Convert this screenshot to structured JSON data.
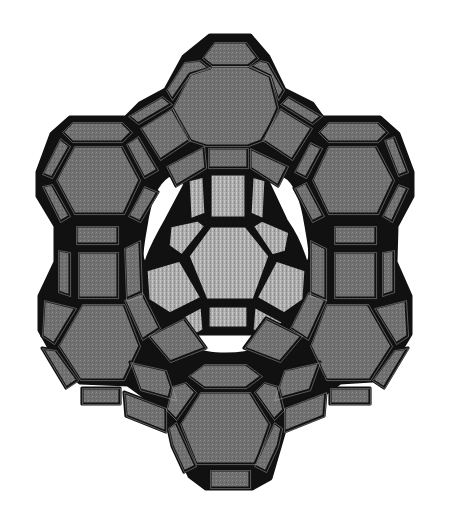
{
  "figure": {
    "width": 451,
    "height": 522,
    "colors": {
      "background": "#ffffff",
      "outer_face": "#6e6e6e",
      "outer_face_light": "#8a8a8a",
      "inner_face": "#a9a9a9",
      "inner_face_light": "#bdbdbd",
      "edge": "#111111",
      "pore": "#ffffff"
    },
    "silhouette": "M210,36 L250,36 L268,57 L284,90 L312,104 L322,118 L380,118 L398,134 L412,172 L412,196 L396,226 L395,262 L410,296 L410,334 L392,364 L372,380 L340,382 L318,398 L300,414 L284,430 L270,478 L252,488 L206,488 L190,476 L170,430 L150,400 L128,384 L80,382 L58,362 L40,330 L40,296 L56,262 L56,226 L38,196 L38,172 L52,134 L70,118 L126,118 L140,104 L166,90 L184,57 Z",
    "outer_faces": [
      {
        "name": "top-cage-top-square",
        "d": "M214,42 L246,42 L258,58 L248,66 L212,66 L202,58 Z"
      },
      {
        "name": "top-cage-hexagon",
        "d": "M190,74 L212,66 L248,66 L270,76 L278,108 L264,140 L248,146 L206,146 L188,140 L172,108 Z"
      },
      {
        "name": "top-cage-left-square",
        "d": "M184,62 L200,60 L210,68 L190,74 L172,100 L166,90 Z"
      },
      {
        "name": "top-cage-right-square",
        "d": "M250,66 L260,60 L268,62 L284,90 L278,100 L270,76 Z"
      },
      {
        "name": "top-left-link",
        "d": "M128,116 L162,96 L172,104 L138,124 Z"
      },
      {
        "name": "top-left-link-2",
        "d": "M140,128 L172,108 L190,140 L160,160 Z"
      },
      {
        "name": "top-right-link",
        "d": "M288,96 L322,116 L312,124 L280,104 Z"
      },
      {
        "name": "top-right-link-2",
        "d": "M280,108 L312,128 L292,160 L262,140 Z"
      },
      {
        "name": "top-bottom-square",
        "d": "M208,148 L248,148 L248,168 L208,168 Z"
      },
      {
        "name": "top-lower-left",
        "d": "M166,166 L204,146 L206,168 L176,186 Z"
      },
      {
        "name": "top-lower-right",
        "d": "M250,148 L288,166 L278,186 L250,168 Z"
      },
      {
        "name": "left-cage-top-square",
        "d": "M72,122 L122,122 L132,132 L122,142 L72,142 L62,132 Z"
      },
      {
        "name": "left-cage-hexagon",
        "d": "M74,146 L122,146 L140,180 L124,214 L74,214 L56,180 Z"
      },
      {
        "name": "left-cage-left-upper",
        "d": "M60,138 L70,146 L52,178 L42,174 Z"
      },
      {
        "name": "left-cage-left-lower",
        "d": "M42,186 L52,184 L70,216 L60,222 Z"
      },
      {
        "name": "left-cage-right-upper",
        "d": "M126,144 L138,136 L158,170 L144,178 Z"
      },
      {
        "name": "left-cage-right-lower",
        "d": "M144,186 L158,192 L140,222 L128,216 Z"
      },
      {
        "name": "left-prism-top",
        "d": "M76,226 L118,226 L118,244 L76,244 Z"
      },
      {
        "name": "left-prism-front",
        "d": "M78,252 L118,252 L118,298 L78,298 Z"
      },
      {
        "name": "left-prism-left",
        "d": "M58,250 L70,252 L70,296 L58,292 Z"
      },
      {
        "name": "left-prism-right",
        "d": "M124,248 L140,240 L142,296 L126,300 Z"
      },
      {
        "name": "right-cage-top-square",
        "d": "M328,122 L378,122 L388,132 L378,142 L328,142 L318,132 Z"
      },
      {
        "name": "right-cage-hexagon",
        "d": "M328,146 L376,146 L394,180 L378,214 L328,214 L312,180 Z"
      },
      {
        "name": "right-cage-left-upper",
        "d": "M310,142 L322,148 L306,178 L294,172 Z"
      },
      {
        "name": "right-cage-left-lower",
        "d": "M294,188 L306,182 L324,216 L312,222 Z"
      },
      {
        "name": "right-cage-right-upper",
        "d": "M384,140 L394,136 L408,172 L398,176 Z"
      },
      {
        "name": "right-cage-right-lower",
        "d": "M398,184 L408,188 L392,222 L382,216 Z"
      },
      {
        "name": "right-prism-top",
        "d": "M334,226 L376,226 L376,244 L334,244 Z"
      },
      {
        "name": "right-prism-front",
        "d": "M334,252 L376,252 L376,298 L334,298 Z"
      },
      {
        "name": "right-prism-left",
        "d": "M310,240 L326,248 L326,300 L310,296 Z"
      },
      {
        "name": "right-prism-right",
        "d": "M382,252 L394,250 L394,292 L382,296 Z"
      },
      {
        "name": "lower-left-cage-hexagon",
        "d": "M82,304 L124,304 L140,346 L124,380 L80,380 L58,346 Z"
      },
      {
        "name": "lower-left-cage-left",
        "d": "M44,300 L76,308 L54,344 L42,336 Z"
      },
      {
        "name": "lower-left-cage-left-lower",
        "d": "M42,348 L56,350 L78,380 L66,388 Z"
      },
      {
        "name": "lower-left-cage-bottom",
        "d": "M82,388 L120,388 L120,404 L82,404 Z"
      },
      {
        "name": "lower-left-cage-right",
        "d": "M124,300 L142,292 L160,328 L142,340 Z"
      },
      {
        "name": "lower-left-link",
        "d": "M148,336 L184,318 L206,348 L170,362 Z"
      },
      {
        "name": "lower-left-link-2",
        "d": "M130,362 L166,370 L176,400 L140,390 Z"
      },
      {
        "name": "lower-left-link-3",
        "d": "M124,392 L166,408 L166,432 L126,416 Z"
      },
      {
        "name": "lower-right-cage-hexagon",
        "d": "M326,304 L368,304 L392,346 L370,380 L326,380 L310,346 Z"
      },
      {
        "name": "lower-right-cage-right",
        "d": "M374,308 L406,300 L408,336 L396,344 Z"
      },
      {
        "name": "lower-right-cage-right-lower",
        "d": "M394,350 L408,348 L384,388 L372,380 Z"
      },
      {
        "name": "lower-right-cage-bottom",
        "d": "M330,388 L370,388 L370,404 L330,404 Z"
      },
      {
        "name": "lower-right-cage-left",
        "d": "M308,292 L326,300 L308,340 L290,328 Z"
      },
      {
        "name": "lower-right-link",
        "d": "M266,318 L302,336 L280,362 L244,348 Z"
      },
      {
        "name": "lower-right-link-2",
        "d": "M284,370 L320,362 L310,390 L274,400 Z"
      },
      {
        "name": "lower-right-link-3",
        "d": "M284,408 L326,392 L324,416 L284,432 Z"
      },
      {
        "name": "bottom-cage-top-square",
        "d": "M204,364 L246,364 L262,376 L246,388 L204,388 L188,376 Z"
      },
      {
        "name": "bottom-cage-hexagon",
        "d": "M200,392 L250,392 L270,424 L256,464 L196,464 L180,424 Z"
      },
      {
        "name": "bottom-cage-left-upper",
        "d": "M172,386 L186,382 L196,392 L176,420 L166,410 Z"
      },
      {
        "name": "bottom-cage-right-upper",
        "d": "M254,392 L264,382 L278,386 L284,410 L274,420 Z"
      },
      {
        "name": "bottom-cage-left-lower",
        "d": "M168,428 L176,422 L196,466 L184,472 L172,446 Z"
      },
      {
        "name": "bottom-cage-right-lower",
        "d": "M274,422 L282,428 L278,446 L266,472 L254,466 Z"
      },
      {
        "name": "bottom-cage-bottom-square",
        "d": "M210,470 L250,470 L250,488 L210,488 Z"
      }
    ],
    "inner_faces": [
      {
        "name": "inner-top-square",
        "d": "M210,174 L246,174 L246,218 L210,218 Z"
      },
      {
        "name": "inner-top-left",
        "d": "M188,180 L204,176 L206,214 L190,220 Z"
      },
      {
        "name": "inner-top-right",
        "d": "M252,176 L266,180 L264,220 L250,214 Z"
      },
      {
        "name": "inner-hexagon",
        "d": "M210,226 L246,226 L270,256 L254,300 L206,300 L188,256 Z"
      },
      {
        "name": "inner-left-upper",
        "d": "M170,226 L198,220 L206,226 L182,256 L168,246 Z"
      },
      {
        "name": "inner-right-upper",
        "d": "M252,226 L262,220 L290,232 L286,252 L272,256 Z"
      },
      {
        "name": "inner-left-lower",
        "d": "M146,270 L180,260 L202,298 L170,314 L148,300 Z"
      },
      {
        "name": "inner-right-lower",
        "d": "M276,260 L306,270 L304,300 L284,314 L256,298 Z"
      },
      {
        "name": "inner-bottom-square",
        "d": "M208,306 L248,306 L248,328 L208,328 Z"
      },
      {
        "name": "inner-bottom-left",
        "d": "M172,322 L202,306 L204,330 L188,340 Z"
      },
      {
        "name": "inner-bottom-right",
        "d": "M254,306 L284,322 L266,340 L252,330 Z"
      }
    ],
    "pores": [
      {
        "name": "left-pore",
        "d": "M168,176 C180,172 186,178 184,186 L166,220 C158,234 150,248 146,262 C140,262 142,248 146,226 C150,200 156,184 168,176 Z"
      },
      {
        "name": "right-pore",
        "d": "M284,176 C296,182 302,200 306,226 C310,248 312,262 306,262 C302,248 296,234 286,220 L270,186 C266,178 272,172 284,176 Z"
      },
      {
        "name": "bottom-pore",
        "d": "M196,334 L254,334 C262,336 266,342 258,348 C246,356 206,356 194,348 C186,342 190,336 196,334 Z"
      }
    ]
  }
}
